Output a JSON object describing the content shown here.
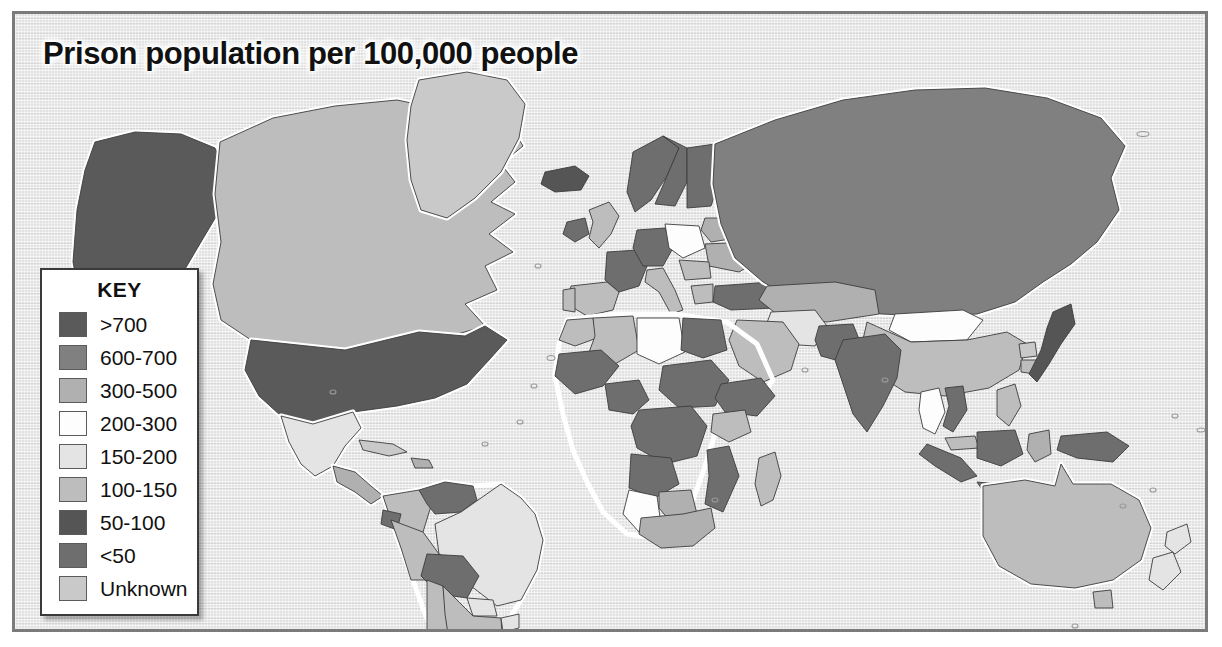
{
  "figure": {
    "title": "Prison population per 100,000 people"
  },
  "legend": {
    "title": "KEY",
    "entries": [
      {
        "label": ">700",
        "color": "#5a5a5a"
      },
      {
        "label": "600-700",
        "color": "#808080"
      },
      {
        "label": "300-500",
        "color": "#b0b0b0"
      },
      {
        "label": "200-300",
        "color": "#fdfdfd"
      },
      {
        "label": "150-200",
        "color": "#e4e4e4"
      },
      {
        "label": "100-150",
        "color": "#bdbdbd"
      },
      {
        "label": "50-100",
        "color": "#555555"
      },
      {
        "label": "<50",
        "color": "#6e6e6e"
      },
      {
        "label": "Unknown",
        "color": "#c9c9c9"
      }
    ]
  },
  "map": {
    "ocean_color": "#e2e2e2",
    "border_color": "#7b7b7b",
    "coast_halo_color": "#ffffff",
    "land_outline_color": "#3c3c3c",
    "projection": "equirectangular world",
    "regions": [
      {
        "name": "United States",
        "category": ">700"
      },
      {
        "name": "Alaska",
        "category": ">700"
      },
      {
        "name": "Canada",
        "category": "100-150"
      },
      {
        "name": "Greenland",
        "category": "Unknown"
      },
      {
        "name": "Mexico",
        "category": "150-200"
      },
      {
        "name": "Central America",
        "category": "300-500"
      },
      {
        "name": "Cuba",
        "category": "Unknown"
      },
      {
        "name": "Caribbean",
        "category": "300-500"
      },
      {
        "name": "Venezuela",
        "category": "<50"
      },
      {
        "name": "Colombia",
        "category": "100-150"
      },
      {
        "name": "Ecuador",
        "category": "<50"
      },
      {
        "name": "Peru",
        "category": "100-150"
      },
      {
        "name": "Bolivia",
        "category": "<50"
      },
      {
        "name": "Brazil",
        "category": "150-200"
      },
      {
        "name": "Chile",
        "category": "100-150"
      },
      {
        "name": "Argentina",
        "category": "100-150"
      },
      {
        "name": "Paraguay",
        "category": "150-200"
      },
      {
        "name": "Uruguay",
        "category": "150-200"
      },
      {
        "name": "Iceland",
        "category": "50-100"
      },
      {
        "name": "United Kingdom",
        "category": "100-150"
      },
      {
        "name": "Ireland",
        "category": "<50"
      },
      {
        "name": "Norway",
        "category": "<50"
      },
      {
        "name": "Sweden",
        "category": "<50"
      },
      {
        "name": "Finland",
        "category": "<50"
      },
      {
        "name": "France",
        "category": "<50"
      },
      {
        "name": "Spain",
        "category": "100-150"
      },
      {
        "name": "Portugal",
        "category": "100-150"
      },
      {
        "name": "Germany",
        "category": "<50"
      },
      {
        "name": "Poland",
        "category": "200-300"
      },
      {
        "name": "Italy",
        "category": "100-150"
      },
      {
        "name": "Ukraine",
        "category": "300-500"
      },
      {
        "name": "Belarus",
        "category": "300-500"
      },
      {
        "name": "Romania",
        "category": "100-150"
      },
      {
        "name": "Greece",
        "category": "100-150"
      },
      {
        "name": "Turkey",
        "category": "<50"
      },
      {
        "name": "Russia",
        "category": "600-700"
      },
      {
        "name": "Kazakhstan",
        "category": "300-500"
      },
      {
        "name": "Mongolia",
        "category": "200-300"
      },
      {
        "name": "China",
        "category": "100-150"
      },
      {
        "name": "Japan",
        "category": "50-100"
      },
      {
        "name": "North Korea",
        "category": "Unknown"
      },
      {
        "name": "South Korea",
        "category": "100-150"
      },
      {
        "name": "India",
        "category": "<50"
      },
      {
        "name": "Pakistan",
        "category": "<50"
      },
      {
        "name": "Iran",
        "category": "150-200"
      },
      {
        "name": "Saudi Arabia",
        "category": "100-150"
      },
      {
        "name": "Egypt",
        "category": "<50"
      },
      {
        "name": "Libya",
        "category": "200-300"
      },
      {
        "name": "Algeria",
        "category": "100-150"
      },
      {
        "name": "Morocco",
        "category": "100-150"
      },
      {
        "name": "Nigeria",
        "category": "<50"
      },
      {
        "name": "Sudan",
        "category": "<50"
      },
      {
        "name": "Ethiopia",
        "category": "<50"
      },
      {
        "name": "Kenya",
        "category": "100-150"
      },
      {
        "name": "DR Congo",
        "category": "<50"
      },
      {
        "name": "Angola",
        "category": "<50"
      },
      {
        "name": "Namibia",
        "category": "200-300"
      },
      {
        "name": "Botswana",
        "category": "300-500"
      },
      {
        "name": "South Africa",
        "category": "300-500"
      },
      {
        "name": "Mozambique",
        "category": "<50"
      },
      {
        "name": "Madagascar",
        "category": "100-150"
      },
      {
        "name": "Thailand",
        "category": "200-300"
      },
      {
        "name": "Vietnam",
        "category": "<50"
      },
      {
        "name": "Indonesia",
        "category": "<50"
      },
      {
        "name": "Malaysia",
        "category": "100-150"
      },
      {
        "name": "Philippines",
        "category": "100-150"
      },
      {
        "name": "Papua New Guinea",
        "category": "<50"
      },
      {
        "name": "Australia",
        "category": "100-150"
      },
      {
        "name": "New Zealand",
        "category": "150-200"
      }
    ]
  }
}
